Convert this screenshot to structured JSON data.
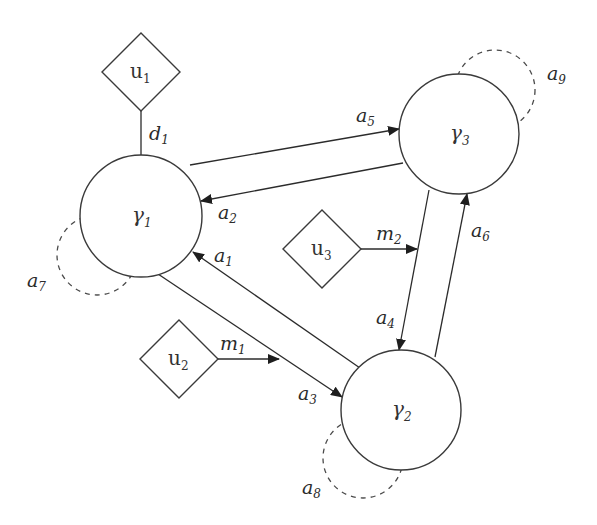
{
  "diagram": {
    "type": "network",
    "nodes": [
      {
        "id": "gamma1",
        "shape": "circle",
        "label": "γ",
        "sub": "1",
        "cx": 141,
        "cy": 216,
        "r": 61
      },
      {
        "id": "gamma2",
        "shape": "circle",
        "label": "γ",
        "sub": "2",
        "cx": 401,
        "cy": 410,
        "r": 60
      },
      {
        "id": "gamma3",
        "shape": "circle",
        "label": "γ",
        "sub": "3",
        "cx": 459,
        "cy": 134,
        "r": 60
      },
      {
        "id": "u1",
        "shape": "diamond",
        "label": "u",
        "sub": "1",
        "cx": 141,
        "cy": 72,
        "half": 39
      },
      {
        "id": "u2",
        "shape": "diamond",
        "label": "u",
        "sub": "2",
        "cx": 179,
        "cy": 359,
        "half": 39
      },
      {
        "id": "u3",
        "shape": "diamond",
        "label": "u",
        "sub": "3",
        "cx": 322,
        "cy": 249,
        "half": 39
      }
    ],
    "edges": [
      {
        "id": "a1",
        "label": "a",
        "sub": "1",
        "from": "gamma2",
        "to": "gamma1",
        "directed": true
      },
      {
        "id": "a2",
        "label": "a",
        "sub": "2",
        "from": "gamma3",
        "to": "gamma1",
        "directed": true
      },
      {
        "id": "a3",
        "label": "a",
        "sub": "3",
        "from": "gamma1",
        "to": "gamma2",
        "directed": true
      },
      {
        "id": "a4",
        "label": "a",
        "sub": "4",
        "from": "gamma3",
        "to": "gamma2",
        "directed": true
      },
      {
        "id": "a5",
        "label": "a",
        "sub": "5",
        "from": "gamma1",
        "to": "gamma3",
        "directed": true
      },
      {
        "id": "a6",
        "label": "a",
        "sub": "6",
        "from": "gamma2",
        "to": "gamma3",
        "directed": true
      },
      {
        "id": "a7",
        "label": "a",
        "sub": "7",
        "from": "gamma1",
        "to": "gamma1",
        "style": "dashed-loop"
      },
      {
        "id": "a8",
        "label": "a",
        "sub": "8",
        "from": "gamma2",
        "to": "gamma2",
        "style": "dashed-loop"
      },
      {
        "id": "a9",
        "label": "a",
        "sub": "9",
        "from": "gamma3",
        "to": "gamma3",
        "style": "dashed-loop"
      },
      {
        "id": "d1",
        "label": "d",
        "sub": "1",
        "from": "u1",
        "to": "gamma1",
        "directed": false
      },
      {
        "id": "m1",
        "label": "m",
        "sub": "1",
        "from": "u2",
        "to": "edge-a3",
        "directed": true
      },
      {
        "id": "m2",
        "label": "m",
        "sub": "2",
        "from": "u3",
        "to": "edge-a4",
        "directed": true
      }
    ]
  },
  "colors": {
    "stroke": "#2b2b2b",
    "background": "#ffffff"
  }
}
